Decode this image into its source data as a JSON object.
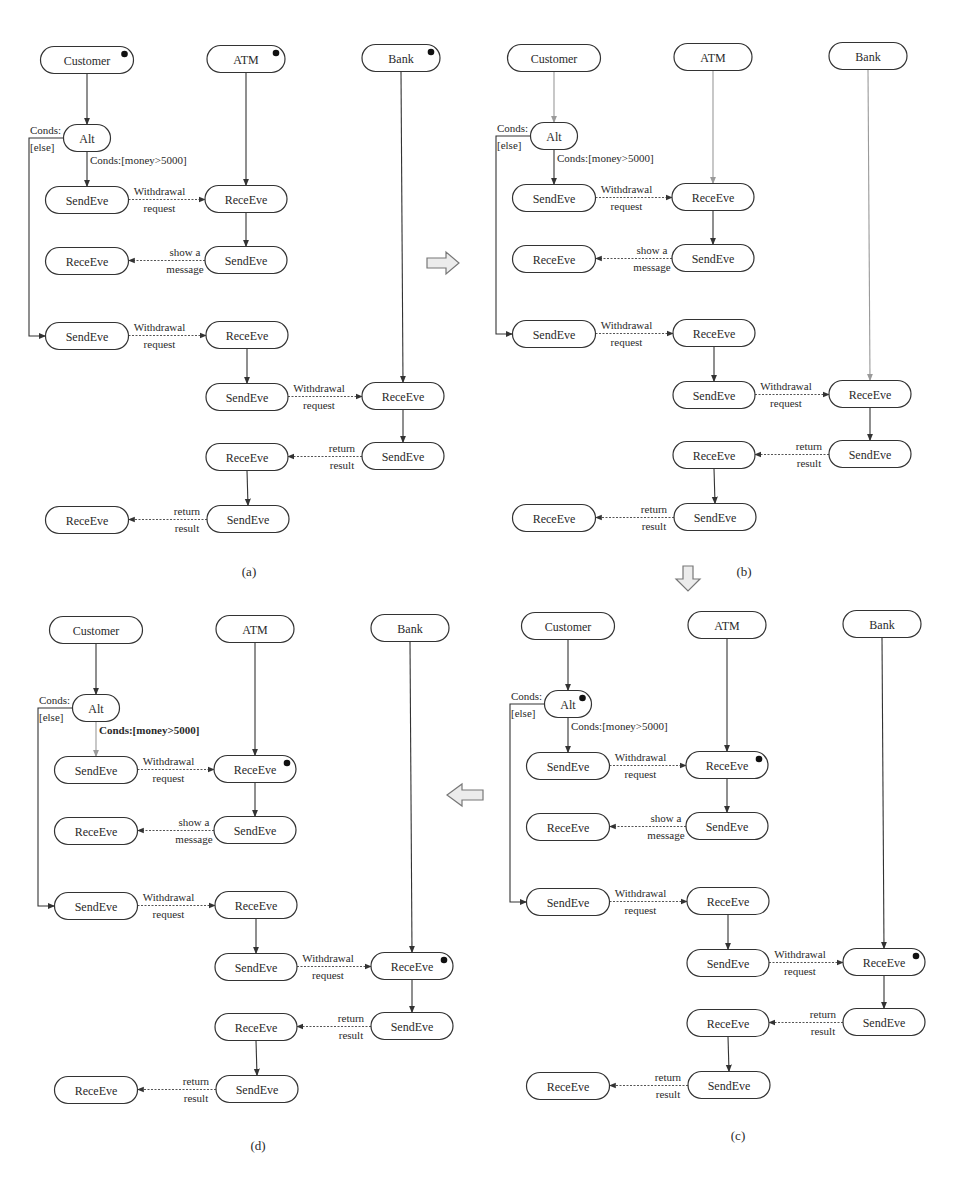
{
  "figure": {
    "panels": [
      {
        "id": "a",
        "caption": "(a)",
        "offset": [
          0,
          0
        ],
        "caption_pos": [
          249,
          576
        ],
        "active_nodes": [
          "customer",
          "atm",
          "bank"
        ],
        "gray_edges": [],
        "bold_condition": false
      },
      {
        "id": "b",
        "caption": "(b)",
        "offset": [
          467,
          -2
        ],
        "caption_pos": [
          744,
          576
        ],
        "active_nodes": [],
        "gray_edges": [
          "customer-alt",
          "atm-rece1",
          "bank-rece4"
        ],
        "bold_condition": false
      },
      {
        "id": "c",
        "caption": "(c)",
        "offset": [
          481,
          566
        ],
        "caption_pos": [
          738,
          1140
        ],
        "active_nodes": [
          "alt",
          "rece1",
          "rece4"
        ],
        "gray_edges": [],
        "bold_condition": false
      },
      {
        "id": "d",
        "caption": "(d)",
        "offset": [
          9,
          570
        ],
        "caption_pos": [
          258,
          1150
        ],
        "active_nodes": [
          "rece1",
          "rece4"
        ],
        "gray_edges": [
          "alt-send1"
        ],
        "bold_condition": true
      }
    ],
    "nodes": [
      {
        "key": "customer",
        "label": "Customer",
        "cx": 87,
        "cy": 60,
        "w": 93
      },
      {
        "key": "atm",
        "label": "ATM",
        "cx": 246,
        "cy": 59,
        "w": 78
      },
      {
        "key": "bank",
        "label": "Bank",
        "cx": 401,
        "cy": 58,
        "w": 78
      },
      {
        "key": "alt",
        "label": "Alt",
        "cx": 87,
        "cy": 138,
        "w": 47
      },
      {
        "key": "send1",
        "label": "SendEve",
        "cx": 87,
        "cy": 200,
        "w": 83
      },
      {
        "key": "rece1",
        "label": "ReceEve",
        "cx": 246,
        "cy": 199,
        "w": 82
      },
      {
        "key": "rece2",
        "label": "ReceEve",
        "cx": 87,
        "cy": 261,
        "w": 83
      },
      {
        "key": "send2",
        "label": "SendEve",
        "cx": 246,
        "cy": 260,
        "w": 82
      },
      {
        "key": "send3",
        "label": "SendEve",
        "cx": 87,
        "cy": 336,
        "w": 83
      },
      {
        "key": "rece3",
        "label": "ReceEve",
        "cx": 247,
        "cy": 335,
        "w": 82
      },
      {
        "key": "send4",
        "label": "SendEve",
        "cx": 247,
        "cy": 397,
        "w": 82
      },
      {
        "key": "rece4",
        "label": "ReceEve",
        "cx": 403,
        "cy": 396,
        "w": 82
      },
      {
        "key": "send5",
        "label": "SendEve",
        "cx": 403,
        "cy": 456,
        "w": 82
      },
      {
        "key": "rece5",
        "label": "ReceEve",
        "cx": 247,
        "cy": 457,
        "w": 82
      },
      {
        "key": "send6",
        "label": "SendEve",
        "cx": 248,
        "cy": 519,
        "w": 82
      },
      {
        "key": "rece6",
        "label": "ReceEve",
        "cx": 87,
        "cy": 520,
        "w": 83
      }
    ],
    "edges": [
      {
        "key": "customer-alt",
        "kind": "control",
        "from": "customer",
        "to": "alt"
      },
      {
        "key": "alt-send1",
        "kind": "control",
        "from": "alt",
        "to": "send1"
      },
      {
        "key": "atm-rece1",
        "kind": "control",
        "from": "atm",
        "to": "rece1"
      },
      {
        "key": "rece1-send2",
        "kind": "control",
        "from": "rece1",
        "to": "send2"
      },
      {
        "key": "rece3-send4",
        "kind": "control",
        "from": "rece3",
        "to": "send4"
      },
      {
        "key": "bank-rece4",
        "kind": "control",
        "from": "bank",
        "to": "rece4"
      },
      {
        "key": "rece4-send5",
        "kind": "control",
        "from": "rece4",
        "to": "send5"
      },
      {
        "key": "rece5-send6",
        "kind": "control",
        "from": "rece5",
        "to": "send6"
      },
      {
        "key": "send1-rece1",
        "kind": "message",
        "from": "send1",
        "to": "rece1",
        "label_top": "Withdrawal",
        "label_bottom": "request"
      },
      {
        "key": "send2-rece2",
        "kind": "message",
        "from": "send2",
        "to": "rece2",
        "label_top": "show a",
        "label_bottom": "message"
      },
      {
        "key": "send3-rece3",
        "kind": "message",
        "from": "send3",
        "to": "rece3",
        "label_top": "Withdrawal",
        "label_bottom": "request"
      },
      {
        "key": "send4-rece4",
        "kind": "message",
        "from": "send4",
        "to": "rece4",
        "label_top": "Withdrawal",
        "label_bottom": "request"
      },
      {
        "key": "send5-rece5",
        "kind": "message",
        "from": "send5",
        "to": "rece5",
        "label_top": "return",
        "label_bottom": "result"
      },
      {
        "key": "send6-rece6",
        "kind": "message",
        "from": "send6",
        "to": "rece6",
        "label_top": "return",
        "label_bottom": "result"
      }
    ],
    "alt_branch": {
      "else_label_top": "Conds:",
      "else_label_bottom": "[else]",
      "if_label": "Conds:[money>5000]",
      "else_x": 29,
      "else_target": "send3"
    },
    "transitions": [
      {
        "key": "a-to-b",
        "direction": "right",
        "x": 443,
        "y": 263
      },
      {
        "key": "b-to-c",
        "direction": "down",
        "x": 688,
        "y": 576
      },
      {
        "key": "c-to-d",
        "direction": "left",
        "x": 465,
        "y": 795
      }
    ]
  }
}
